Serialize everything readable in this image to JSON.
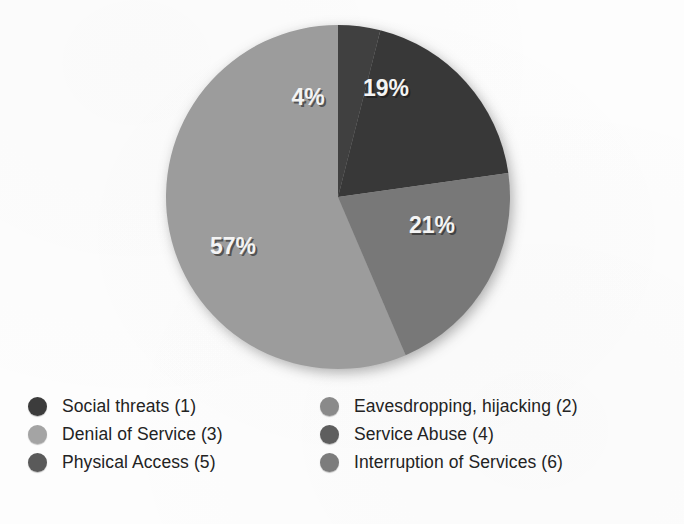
{
  "chart_data": {
    "type": "pie",
    "title": "",
    "subtitle": "",
    "xlabel": "",
    "ylabel": "",
    "grid": false,
    "legend_position": "bottom",
    "legend_columns": 2,
    "units": "percent",
    "categories": [
      "Social threats (1)",
      "Eavesdropping, hijacking (2)",
      "Denial of Service (3)",
      "Service Abuse (4)",
      "Physical Access (5)",
      "Interruption of Services (6)"
    ],
    "values": [
      19,
      0,
      57,
      21,
      4,
      0
    ],
    "value_labels": [
      "19%",
      "",
      "57%",
      "21%",
      "4%",
      ""
    ],
    "colors": [
      "#3a3a3a",
      "#7d7d7d",
      "#9e9e9e",
      "#6e6e6e",
      "#444444",
      "#767676"
    ],
    "visible_slices": [
      {
        "label": "4%",
        "value": 4,
        "color": "#3f3f3f",
        "category": "Physical Access (5)"
      },
      {
        "label": "19%",
        "value": 19,
        "color": "#393939",
        "category": "Social threats (1)"
      },
      {
        "label": "21%",
        "value": 21,
        "color": "#787878",
        "category": "Service Abuse (4)"
      },
      {
        "label": "57%",
        "value": 57,
        "color": "#9c9c9c",
        "category": "Denial of Service (3)"
      }
    ],
    "total": 101
  },
  "legend": {
    "left_column": [
      {
        "label": "Social threats (1)",
        "color": "#3c3c3c"
      },
      {
        "label": "Denial of Service (3)",
        "color": "#a4a4a4"
      },
      {
        "label": "Physical Access (5)",
        "color": "#5a5a5a"
      }
    ],
    "right_column": [
      {
        "label": "Eavesdropping, hijacking (2)",
        "color": "#8a8a8a"
      },
      {
        "label": "Service Abuse (4)",
        "color": "#5e5e5e"
      },
      {
        "label": "Interruption of Services (6)",
        "color": "#7c7c7c"
      }
    ]
  },
  "slice_text": {
    "s4": "4%",
    "s19": "19%",
    "s21": "21%",
    "s57": "57%"
  }
}
